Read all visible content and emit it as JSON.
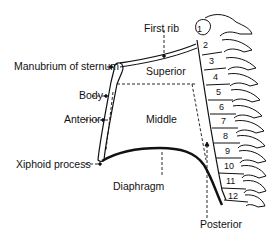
{
  "diagram": {
    "labels": {
      "first_rib": "First rib",
      "manubrium": "Manubrium of sternum",
      "body": "Body",
      "anterior": "Anterior",
      "xiphoid": "Xiphoid process",
      "superior": "Superior",
      "middle": "Middle",
      "diaphragm": "Diaphragm",
      "posterior": "Posterior"
    },
    "vertebrae": [
      "1",
      "2",
      "3",
      "4",
      "5",
      "6",
      "7",
      "8",
      "9",
      "10",
      "11",
      "12"
    ],
    "colors": {
      "line": "#111111",
      "bone_fill": "#ffffff"
    }
  }
}
